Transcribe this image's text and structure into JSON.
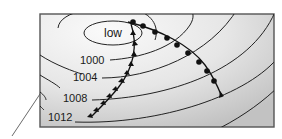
{
  "diagram": {
    "type": "weather-map",
    "center_label": "low",
    "isobars": [
      {
        "label": "1000"
      },
      {
        "label": "1004"
      },
      {
        "label": "1008"
      },
      {
        "label": "1012"
      }
    ],
    "fronts": [
      {
        "kind": "cold-front",
        "symbol": "triangles"
      },
      {
        "kind": "warm-front",
        "symbol": "semicircles"
      }
    ],
    "colors": {
      "frame": "#555555",
      "isobar": "#222222",
      "front": "#111111",
      "fill_light": "#f6f6f6",
      "fill_dark": "#c4c4c4"
    }
  }
}
